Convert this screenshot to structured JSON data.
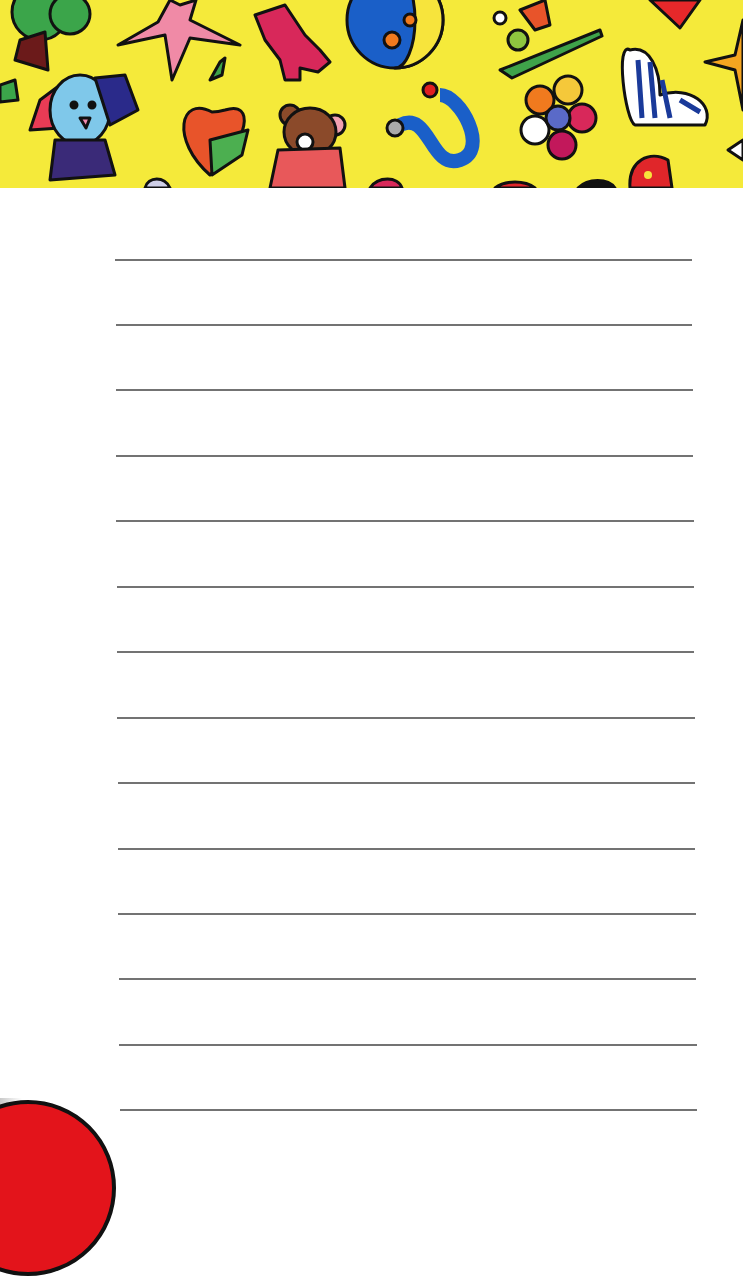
{
  "header": {
    "background_color": "#f5ea3a",
    "illustrations": [
      "tree-icon",
      "star-icon",
      "bear-icon",
      "ball-icon",
      "bird-icon",
      "heart-icon",
      "dog-icon",
      "apple-icon",
      "teddy-bear-icon",
      "snake-icon",
      "flower-icon",
      "striped-heart-icon",
      "dotted-heart-icon",
      "star-right-icon"
    ]
  },
  "paper": {
    "background_color": "#ffffff",
    "line_color": "#5a5a5a",
    "lines": [
      {
        "y": 259,
        "x1": 115,
        "x2": 692
      },
      {
        "y": 324,
        "x1": 116,
        "x2": 692
      },
      {
        "y": 389,
        "x1": 116,
        "x2": 693
      },
      {
        "y": 455,
        "x1": 116,
        "x2": 693
      },
      {
        "y": 520,
        "x1": 116,
        "x2": 694
      },
      {
        "y": 586,
        "x1": 117,
        "x2": 694
      },
      {
        "y": 651,
        "x1": 117,
        "x2": 694
      },
      {
        "y": 717,
        "x1": 117,
        "x2": 695
      },
      {
        "y": 782,
        "x1": 118,
        "x2": 695
      },
      {
        "y": 848,
        "x1": 118,
        "x2": 695
      },
      {
        "y": 913,
        "x1": 118,
        "x2": 696
      },
      {
        "y": 978,
        "x1": 119,
        "x2": 696
      },
      {
        "y": 1044,
        "x1": 119,
        "x2": 697
      },
      {
        "y": 1109,
        "x1": 120,
        "x2": 697
      }
    ]
  },
  "decoration": {
    "red_circle_color": "#e3141b"
  }
}
